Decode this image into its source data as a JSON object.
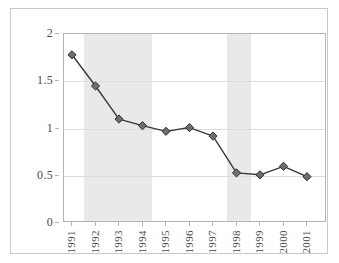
{
  "chart_data": {
    "type": "line",
    "title": "",
    "subtitle": "",
    "xlabel": "",
    "ylabel": "",
    "categories": [
      "1991",
      "1992",
      "1993",
      "1994",
      "1995",
      "1996",
      "1997",
      "1998",
      "1999",
      "2000",
      "2001"
    ],
    "values": [
      1.78,
      1.45,
      1.1,
      1.03,
      0.97,
      1.01,
      0.92,
      0.53,
      0.51,
      0.6,
      0.49
    ],
    "series": [
      {
        "name": "",
        "values": [
          1.78,
          1.45,
          1.1,
          1.03,
          0.97,
          1.01,
          0.92,
          0.53,
          0.51,
          0.6,
          0.49
        ]
      }
    ],
    "ylim": [
      0,
      2
    ],
    "y_ticks": [
      0,
      0.5,
      1,
      1.5,
      2
    ],
    "y_tick_labels": [
      "0",
      "0.5",
      "1",
      "1.5",
      "2"
    ],
    "x_tick_labels": [
      "1991",
      "1992",
      "1993",
      "1994",
      "1995",
      "1996",
      "1997",
      "1998",
      "1999",
      "2000",
      "2001"
    ],
    "grid": true,
    "legend": null,
    "legend_position": "none",
    "marker": "diamond",
    "line_color": "#3a3a3a",
    "marker_color": "#6e6e6e",
    "marker_edge_color": "#2e2e2e",
    "shaded_bands": [
      {
        "label": "",
        "x_start": "1991.5",
        "x_end": "1994.4",
        "color": "#e9e9e9"
      },
      {
        "label": "",
        "x_start": "1997.6",
        "x_end": "1998.6",
        "color": "#e9e9e9"
      }
    ],
    "annotations": []
  },
  "colors": {
    "background": "#ffffff",
    "frame": "#c9c9c9",
    "axis": "#b4b4b4",
    "gridline": "#dcdcdc",
    "band": "#e9e9e9",
    "text": "#4a4a4a",
    "line": "#3a3a3a",
    "marker_fill": "#6e6e6e"
  }
}
